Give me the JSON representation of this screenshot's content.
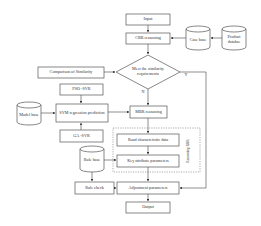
{
  "nodes": {
    "input": "Input",
    "cbr": "CBR reasoning",
    "case_base": "Case base",
    "product_db": "Product databse",
    "decision": "Meet the similarity requirements",
    "comparison": "Comparison of Similarity",
    "pso_svr": "PSO -SVR",
    "model_base": "Model base",
    "svm": "SVM regression prediction",
    "mbr": "MBR reasoning",
    "ga_svr": "GA -SVR",
    "road_data": "Road characteristic data",
    "key_params": "Key attribute parameters",
    "rule_base": "Rule base",
    "rule_check": "Rule check",
    "adjust": "Adjustment parameters",
    "output": "Output",
    "rbr_group": "Reasoning RBR"
  },
  "edge_labels": {
    "yes": "Y",
    "no": "N"
  },
  "colors": {
    "stroke": "#555555",
    "dashed": "#888888",
    "text": "#333333"
  }
}
